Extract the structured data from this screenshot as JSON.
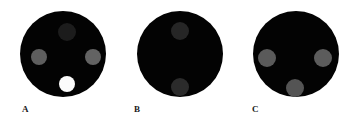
{
  "figure": {
    "width": 360,
    "height": 132,
    "background_color": "#ffffff",
    "disc_color": "#030303",
    "label_color": "#1a1a1a",
    "panel_count": 3
  },
  "panels": [
    {
      "label": "A",
      "label_x": 22,
      "label_y": 110,
      "disc": {
        "cx": 63,
        "cy": 54,
        "r": 43
      },
      "spots": [
        {
          "name": "spot-top",
          "cx": 67,
          "cy": 32,
          "r": 9,
          "color": "#1c1c1c",
          "brightness": "very dark"
        },
        {
          "name": "spot-left",
          "cx": 39,
          "cy": 57,
          "r": 8,
          "color": "#5e5e5e",
          "brightness": "medium gray"
        },
        {
          "name": "spot-right",
          "cx": 93,
          "cy": 57,
          "r": 8,
          "color": "#636363",
          "brightness": "medium gray"
        },
        {
          "name": "spot-bottom",
          "cx": 67,
          "cy": 84,
          "r": 8,
          "color": "#fbfbfb",
          "brightness": "white"
        }
      ]
    },
    {
      "label": "B",
      "label_x": 134,
      "label_y": 110,
      "disc": {
        "cx": 180,
        "cy": 54,
        "r": 43
      },
      "spots": [
        {
          "name": "spot-top",
          "cx": 180,
          "cy": 31,
          "r": 9,
          "color": "#262626",
          "brightness": "dark gray"
        },
        {
          "name": "spot-bottom",
          "cx": 180,
          "cy": 87,
          "r": 9,
          "color": "#2b2b2b",
          "brightness": "dark gray"
        }
      ]
    },
    {
      "label": "C",
      "label_x": 252,
      "label_y": 110,
      "disc": {
        "cx": 296,
        "cy": 54,
        "r": 43
      },
      "spots": [
        {
          "name": "spot-left",
          "cx": 267,
          "cy": 58,
          "r": 9,
          "color": "#5a5a5a",
          "brightness": "medium gray"
        },
        {
          "name": "spot-right",
          "cx": 323,
          "cy": 58,
          "r": 9,
          "color": "#5c5c5c",
          "brightness": "medium gray"
        },
        {
          "name": "spot-bottom",
          "cx": 295,
          "cy": 88,
          "r": 9,
          "color": "#545454",
          "brightness": "medium gray"
        }
      ]
    }
  ]
}
